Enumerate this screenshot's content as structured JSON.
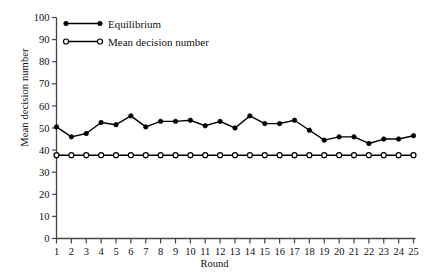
{
  "chart_data": {
    "type": "line",
    "title": "",
    "xlabel": "Round",
    "ylabel": "Mean decision number",
    "xlim": [
      1,
      25
    ],
    "ylim": [
      0,
      100
    ],
    "ytick_step": 10,
    "grid": false,
    "legend_position": "top-left",
    "x": [
      1,
      2,
      3,
      4,
      5,
      6,
      7,
      8,
      9,
      10,
      11,
      12,
      13,
      14,
      15,
      16,
      17,
      18,
      19,
      20,
      21,
      22,
      23,
      24,
      25
    ],
    "xticklabels": [
      "1",
      "2",
      "3",
      "4",
      "5",
      "6",
      "7",
      "8",
      "9",
      "10",
      "11",
      "12",
      "13",
      "14",
      "15",
      "16",
      "17",
      "18",
      "19",
      "20",
      "21",
      "22",
      "23",
      "24",
      "25"
    ],
    "yticklabels": [
      "0",
      "10",
      "20",
      "30",
      "40",
      "50",
      "60",
      "70",
      "80",
      "90",
      "100"
    ],
    "series": [
      {
        "name": "Equilibrium",
        "marker": "filled-circle",
        "values": [
          50.5,
          46.0,
          47.5,
          52.5,
          51.5,
          55.5,
          50.5,
          53.0,
          53.0,
          53.5,
          51.0,
          53.0,
          50.0,
          55.5,
          52.0,
          52.0,
          53.5,
          49.0,
          44.5,
          46.0,
          46.0,
          43.0,
          45.0,
          45.0,
          46.5
        ]
      },
      {
        "name": "Mean decision number",
        "marker": "open-circle",
        "values": [
          37.7,
          37.7,
          37.7,
          37.7,
          37.7,
          37.7,
          37.7,
          37.7,
          37.7,
          37.7,
          37.7,
          37.7,
          37.7,
          37.7,
          37.7,
          37.7,
          37.7,
          37.7,
          37.7,
          37.7,
          37.7,
          37.7,
          37.7,
          37.7,
          37.7
        ]
      }
    ],
    "colors": {
      "series": "#000000",
      "axis": "#444444",
      "background": "#ffffff"
    }
  },
  "legend": {
    "items": [
      {
        "label": "Equilibrium",
        "marker": "filled-circle"
      },
      {
        "label": "Mean decision number",
        "marker": "open-circle"
      }
    ]
  },
  "axes": {
    "x_title": "Round",
    "y_title": "Mean decision number"
  }
}
